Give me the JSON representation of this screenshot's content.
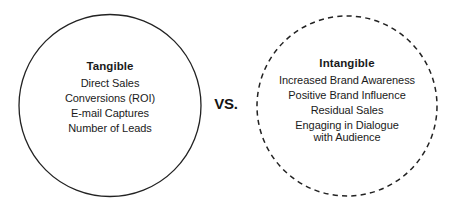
{
  "canvas": {
    "width": 457,
    "height": 210,
    "background": "#ffffff",
    "text_color": "#1a1a1a",
    "stroke_color": "#222222"
  },
  "diagram": {
    "comparison_label": "VS.",
    "left_group": {
      "title": "Tangible",
      "border_style": "solid",
      "items": [
        "Direct Sales",
        "Conversions (ROI)",
        "E-mail Captures",
        "Number of Leads"
      ]
    },
    "right_group": {
      "title": "Intangible",
      "border_style": "dashed",
      "items": [
        "Increased Brand Awareness",
        "Positive Brand Influence",
        "Residual Sales",
        "Engaging in Dialogue",
        "with Audience"
      ]
    }
  }
}
